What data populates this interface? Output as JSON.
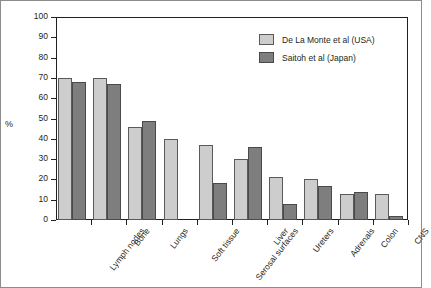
{
  "chart_data": {
    "type": "bar",
    "title": "",
    "xlabel": "",
    "ylabel": "%",
    "ylim": [
      0,
      100
    ],
    "ytick_step": 10,
    "yticks": [
      100,
      90,
      80,
      70,
      60,
      50,
      40,
      30,
      20,
      10,
      0
    ],
    "grid": false,
    "legend_position": "top-right",
    "categories": [
      "Lymph nodes",
      "Bone",
      "Lungs",
      "Soft tissue",
      "Serosal surfaces",
      "Liver",
      "Ureters",
      "Adrenals",
      "Colon",
      "CNS"
    ],
    "series": [
      {
        "name": "De La Monte et al (USA)",
        "color": "#cdcdcd",
        "values": [
          70,
          70,
          46,
          40,
          37,
          30,
          21,
          20,
          13,
          13
        ]
      },
      {
        "name": "Saitoh et al (Japan)",
        "color": "#7e7e7e",
        "values": [
          68,
          67,
          49,
          null,
          18,
          36,
          8,
          17,
          14,
          2
        ]
      }
    ]
  },
  "legend": {
    "items": [
      {
        "label": "De La Monte et al (USA)",
        "swatch": "usa"
      },
      {
        "label": "Saitoh et al (Japan)",
        "swatch": "jpn"
      }
    ]
  }
}
